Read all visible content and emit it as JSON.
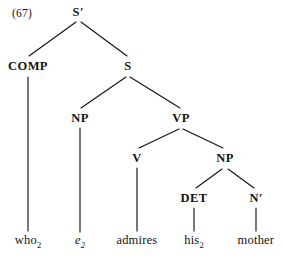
{
  "figure": {
    "example_number": "(67)",
    "type": "syntactic-tree",
    "sentence": "who2 e2 admires his2 mother",
    "ink_color": "#141414",
    "background_color": "#ffffff"
  },
  "nodes": {
    "s_bar": {
      "label": "S",
      "prime": "′",
      "x": 78,
      "y": 12
    },
    "comp": {
      "label": "COMP",
      "x": 28,
      "y": 66
    },
    "s": {
      "label": "S",
      "x": 128,
      "y": 66
    },
    "np_subject": {
      "label": "NP",
      "x": 80,
      "y": 118
    },
    "vp": {
      "label": "VP",
      "x": 181,
      "y": 118
    },
    "v": {
      "label": "V",
      "x": 137,
      "y": 158
    },
    "np_object": {
      "label": "NP",
      "x": 225,
      "y": 158
    },
    "det": {
      "label": "DET",
      "x": 194,
      "y": 198
    },
    "n_bar": {
      "label": "N",
      "prime": "′",
      "x": 256,
      "y": 198
    }
  },
  "leaves": {
    "who": {
      "word": "who",
      "subscript": "2",
      "italic": false,
      "x": 28,
      "y": 241
    },
    "trace": {
      "word": "e",
      "subscript": "2",
      "italic": true,
      "x": 80,
      "y": 241
    },
    "admires": {
      "word": "admires",
      "subscript": "",
      "italic": false,
      "x": 137,
      "y": 241
    },
    "his": {
      "word": "his",
      "subscript": "2",
      "italic": false,
      "x": 194,
      "y": 241
    },
    "mother": {
      "word": "mother",
      "subscript": "",
      "italic": false,
      "x": 256,
      "y": 241
    }
  },
  "edges": [
    {
      "from": "s_bar",
      "to": "comp",
      "x1": 76,
      "y1": 22,
      "x2": 29,
      "y2": 56
    },
    {
      "from": "s_bar",
      "to": "s",
      "x1": 81,
      "y1": 22,
      "x2": 127,
      "y2": 56
    },
    {
      "from": "comp",
      "to": "who",
      "x1": 28,
      "y1": 77,
      "x2": 28,
      "y2": 231
    },
    {
      "from": "s",
      "to": "np_subject",
      "x1": 126,
      "y1": 77,
      "x2": 81,
      "y2": 108
    },
    {
      "from": "s",
      "to": "vp",
      "x1": 130,
      "y1": 77,
      "x2": 180,
      "y2": 108
    },
    {
      "from": "np_subject",
      "to": "trace",
      "x1": 80,
      "y1": 128,
      "x2": 80,
      "y2": 232
    },
    {
      "from": "vp",
      "to": "v",
      "x1": 179,
      "y1": 129,
      "x2": 139,
      "y2": 148
    },
    {
      "from": "vp",
      "to": "np_object",
      "x1": 183,
      "y1": 129,
      "x2": 223,
      "y2": 148
    },
    {
      "from": "v",
      "to": "admires",
      "x1": 137,
      "y1": 168,
      "x2": 137,
      "y2": 231
    },
    {
      "from": "np_object",
      "to": "det",
      "x1": 222,
      "y1": 169,
      "x2": 196,
      "y2": 188
    },
    {
      "from": "np_object",
      "to": "n_bar",
      "x1": 228,
      "y1": 169,
      "x2": 254,
      "y2": 188
    },
    {
      "from": "det",
      "to": "his",
      "x1": 194,
      "y1": 208,
      "x2": 194,
      "y2": 231
    },
    {
      "from": "n_bar",
      "to": "mother",
      "x1": 256,
      "y1": 208,
      "x2": 256,
      "y2": 231
    }
  ]
}
